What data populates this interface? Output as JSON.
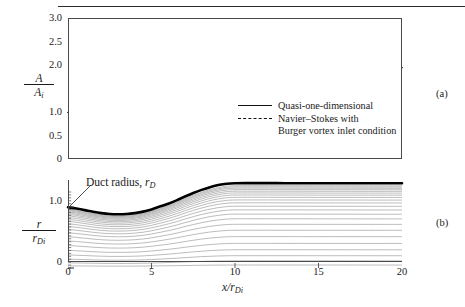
{
  "figure": {
    "panel_a_letter": "(a)",
    "panel_b_letter": "(b)",
    "annotation": {
      "text": "Duct radius, ",
      "symbol": "r",
      "symbol_sub": "D"
    }
  },
  "legend": {
    "entries": [
      {
        "style": "solid",
        "label": "Quasi-one-dimensional",
        "label2": ""
      },
      {
        "style": "dashed",
        "label": "Navier–Stokes with",
        "label2": "Burger vortex inlet condition"
      }
    ]
  },
  "axis_labels": {
    "y_a_num": "A",
    "y_a_den": "A",
    "y_a_den_sub": "i",
    "y_b_num": "r",
    "y_b_den": "r",
    "y_b_den_sub": "Di",
    "x_num": "x",
    "x_den": "r",
    "x_den_sub": "Di"
  },
  "ticks": {
    "y_a": [
      "3.0",
      "2.5",
      "2.0",
      "1.5",
      "1.0",
      "0.5",
      "0"
    ],
    "y_b": [
      "1.0",
      "0"
    ],
    "x": [
      "0",
      "5",
      "10",
      "15",
      "20"
    ]
  },
  "chart_data": {
    "type": "line",
    "title": "",
    "panels": [
      {
        "id": "a",
        "label": "(a)",
        "xlabel": "x/r_Di",
        "ylabel": "A/A_i",
        "xlim": [
          0,
          20
        ],
        "ylim": [
          0,
          3.0
        ],
        "ytick_values": [
          3.0,
          2.5,
          2.0,
          1.5,
          1.0,
          0.5,
          0
        ],
        "ytick_labeled": [
          3.0,
          2.5,
          2.0,
          1.0,
          0.5,
          0
        ],
        "xtick_values": [
          0,
          5,
          10,
          15,
          20
        ],
        "grid": false,
        "legend_position": "inside-right",
        "series": [
          {
            "name": "Quasi-one-dimensional",
            "style": "solid",
            "color": "#111111",
            "x": [
              0,
              0.5,
              1.0,
              1.5,
              2.0,
              2.5,
              3.0,
              3.5,
              4.0,
              4.5,
              5.0,
              5.5,
              6.0,
              6.5,
              7.0,
              7.5,
              8.0,
              8.5,
              9.0,
              9.5,
              10.0,
              11.0,
              12.0,
              13.0,
              14.0,
              15.0,
              16.0,
              17.0,
              18.0,
              19.0,
              20.0
            ],
            "y": [
              0.99,
              0.955,
              0.905,
              0.855,
              0.815,
              0.79,
              0.782,
              0.79,
              0.815,
              0.86,
              0.93,
              1.02,
              1.12,
              1.24,
              1.38,
              1.52,
              1.65,
              1.77,
              1.86,
              1.92,
              1.945,
              1.948,
              1.948,
              1.947,
              1.946,
              1.945,
              1.945,
              1.944,
              1.944,
              1.944,
              1.943
            ]
          },
          {
            "name": "Navier–Stokes with Burger vortex inlet condition",
            "style": "dashed",
            "color": "#111111",
            "x": [
              0,
              0.5,
              1.0,
              1.5,
              2.0,
              2.5,
              3.0,
              3.5,
              4.0,
              4.5,
              5.0,
              5.5,
              6.0,
              6.5,
              7.0,
              7.5,
              8.0,
              8.5,
              9.0,
              9.5,
              10.0,
              11.0,
              12.0,
              13.0,
              14.0,
              15.0,
              16.0,
              17.0,
              18.0,
              19.0,
              20.0
            ],
            "y": [
              0.99,
              0.955,
              0.905,
              0.855,
              0.812,
              0.787,
              0.78,
              0.788,
              0.815,
              0.862,
              0.935,
              1.03,
              1.135,
              1.255,
              1.395,
              1.545,
              1.685,
              1.805,
              1.89,
              1.955,
              1.985,
              1.988,
              1.985,
              1.982,
              1.978,
              1.974,
              1.97,
              1.964,
              1.958,
              1.952,
              1.945
            ]
          }
        ]
      },
      {
        "id": "b",
        "label": "(b)",
        "xlabel": "x/r_Di",
        "ylabel": "r/r_Di",
        "xlim": [
          0,
          20
        ],
        "ylim": [
          0,
          1.25
        ],
        "ytick_labeled": [
          1.0,
          0
        ],
        "xtick_values": [
          0,
          5,
          10,
          15,
          20
        ],
        "grid": false,
        "annotation": "Duct radius, r_D",
        "duct_wall": {
          "name": "Duct radius",
          "style": "thick-solid",
          "color": "#000000",
          "x": [
            0,
            0.5,
            1.0,
            1.5,
            2.0,
            2.5,
            3.0,
            3.5,
            4.0,
            4.5,
            5.0,
            5.5,
            6.0,
            6.5,
            7.0,
            7.5,
            8.0,
            8.5,
            9.0,
            9.5,
            10.0,
            11.0,
            12.0,
            13.0,
            14.0,
            15.0,
            16.0,
            17.0,
            18.0,
            19.0,
            20.0
          ],
          "y": [
            1.0,
            0.978,
            0.952,
            0.925,
            0.903,
            0.889,
            0.885,
            0.889,
            0.903,
            0.927,
            0.964,
            1.01,
            1.058,
            1.113,
            1.175,
            1.233,
            1.285,
            1.33,
            1.364,
            1.387,
            1.395,
            1.396,
            1.396,
            1.395,
            1.395,
            1.394,
            1.394,
            1.394,
            1.393,
            1.393,
            1.393
          ]
        },
        "streamlines": {
          "count": 22,
          "style": "thin-solid",
          "color": "#8c8c8c",
          "description": "Streamlines scaled by local duct radius; densely packed near the wall, sparse near the centerline",
          "psi_fractions": [
            0.035,
            0.085,
            0.145,
            0.215,
            0.29,
            0.37,
            0.445,
            0.515,
            0.58,
            0.635,
            0.685,
            0.728,
            0.768,
            0.802,
            0.833,
            0.86,
            0.884,
            0.905,
            0.924,
            0.941,
            0.956,
            0.97
          ]
        }
      }
    ]
  }
}
